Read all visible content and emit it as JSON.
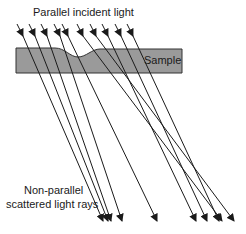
{
  "labels": {
    "incident": "Parallel incident light",
    "sample": "Sample",
    "scattered_line1": "Non-parallel",
    "scattered_line2": "scattered light rays"
  },
  "colors": {
    "sample_fill": "#9a9a9a",
    "sample_stroke": "#333333",
    "ray": "#1a1a1a"
  },
  "incident_rays": [
    {
      "x1": 17,
      "y1": 24,
      "x2": 23,
      "y2": 36
    },
    {
      "x1": 29,
      "y1": 24,
      "x2": 35,
      "y2": 36
    },
    {
      "x1": 41,
      "y1": 24,
      "x2": 47,
      "y2": 36
    },
    {
      "x1": 54,
      "y1": 24,
      "x2": 60,
      "y2": 36
    },
    {
      "x1": 62,
      "y1": 24,
      "x2": 68,
      "y2": 36
    },
    {
      "x1": 77,
      "y1": 24,
      "x2": 83,
      "y2": 36
    },
    {
      "x1": 90,
      "y1": 24,
      "x2": 96,
      "y2": 36
    },
    {
      "x1": 102,
      "y1": 24,
      "x2": 108,
      "y2": 36
    },
    {
      "x1": 115,
      "y1": 24,
      "x2": 121,
      "y2": 36
    },
    {
      "x1": 127,
      "y1": 24,
      "x2": 133,
      "y2": 36
    }
  ],
  "scattered_rays": [
    {
      "x1": 23,
      "y1": 36,
      "x2": 103,
      "y2": 221
    },
    {
      "x1": 35,
      "y1": 36,
      "x2": 108,
      "y2": 221
    },
    {
      "x1": 47,
      "y1": 36,
      "x2": 111,
      "y2": 221
    },
    {
      "x1": 60,
      "y1": 36,
      "x2": 122,
      "y2": 221
    },
    {
      "x1": 68,
      "y1": 36,
      "x2": 157,
      "y2": 221
    },
    {
      "x1": 83,
      "y1": 36,
      "x2": 222,
      "y2": 221
    },
    {
      "x1": 96,
      "y1": 36,
      "x2": 234,
      "y2": 221
    },
    {
      "x1": 108,
      "y1": 36,
      "x2": 196,
      "y2": 221
    },
    {
      "x1": 121,
      "y1": 36,
      "x2": 207,
      "y2": 221
    },
    {
      "x1": 133,
      "y1": 36,
      "x2": 219,
      "y2": 221
    }
  ]
}
